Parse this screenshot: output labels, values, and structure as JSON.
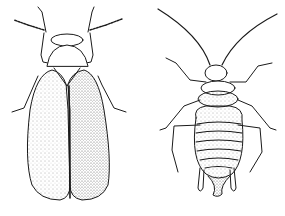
{
  "image": {
    "width": 285,
    "height": 216,
    "background": "#ffffff",
    "ink_color": "#1a1a1a",
    "style": "black-and-white pen illustration with stippling"
  },
  "figures": [
    {
      "name": "winged-insect",
      "position": "left",
      "description": "Adult winged insect, dorsal view, folded elongated wings, segmented antennae, six legs"
    },
    {
      "name": "aphid-nymph",
      "position": "right",
      "description": "Wingless aphid, dorsal view, long curved antennae, segmented striped abdomen, cornicles, six legs"
    }
  ]
}
